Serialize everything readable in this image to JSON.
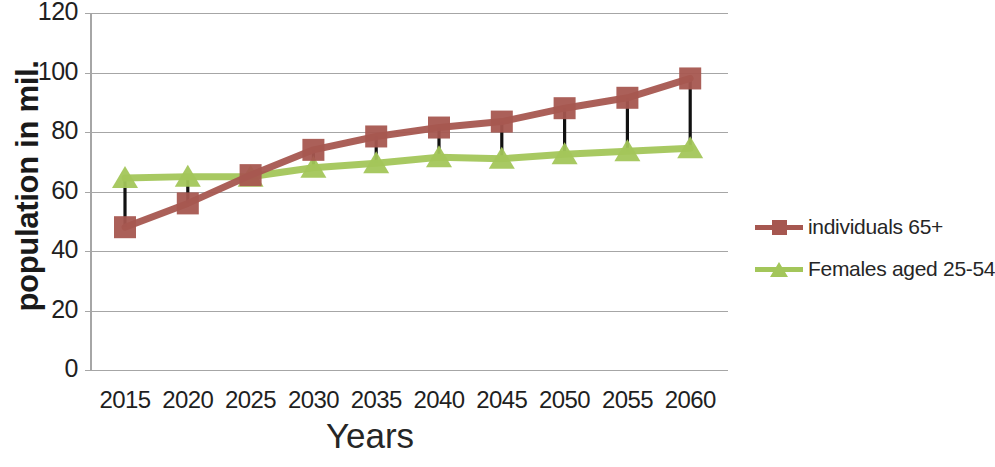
{
  "chart_data": {
    "type": "line",
    "title": "",
    "xlabel": "Years",
    "ylabel": "population in mil.",
    "categories": [
      "2015",
      "2020",
      "2025",
      "2030",
      "2035",
      "2040",
      "2045",
      "2050",
      "2055",
      "2060"
    ],
    "ylim": [
      0,
      120
    ],
    "yticks": [
      0,
      20,
      40,
      60,
      80,
      100,
      120
    ],
    "grid": true,
    "legend_position": "right",
    "connector_lines": true,
    "series": [
      {
        "name": "individuals 65+",
        "color": "#a65750",
        "marker": "square",
        "values": [
          48,
          56,
          65.5,
          74,
          78.5,
          81.5,
          83.5,
          88,
          91.5,
          98
        ]
      },
      {
        "name": "Females aged 25-54",
        "color": "#a3c martial",
        "marker": "triangle",
        "values": [
          64.5,
          65,
          65,
          68,
          69.5,
          71.5,
          71,
          72.5,
          73.5,
          74.5
        ]
      }
    ]
  },
  "legend": {
    "items": [
      {
        "label": "individuals 65+",
        "color": "#a65750",
        "marker": "square"
      },
      {
        "label": "Females aged 25-54",
        "color": "#a3c65a",
        "marker": "triangle"
      }
    ]
  },
  "axes": {
    "y_title": "population in mil.",
    "x_title": "Years",
    "y_tick_labels": [
      "120",
      "100",
      "80",
      "60",
      "40",
      "20",
      "0"
    ],
    "x_tick_labels": [
      "2015",
      "2020",
      "2025",
      "2030",
      "2035",
      "2040",
      "2045",
      "2050",
      "2055",
      "2060"
    ]
  },
  "colors": {
    "series_red": "#a65750",
    "series_green": "#a3c65a",
    "grid": "#a6a6a6",
    "connector": "#111111",
    "text": "#1f1f1f",
    "background": "#ffffff"
  }
}
